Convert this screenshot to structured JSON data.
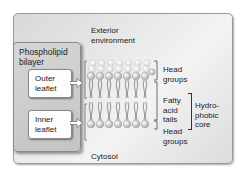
{
  "diagram": {
    "title_panel": {
      "label_line1": "Phospholipid",
      "label_line2": "bilayer"
    },
    "outer_leaflet": {
      "line1": "Outer",
      "line2": "leaflet"
    },
    "inner_leaflet": {
      "line1": "Inner",
      "line2": "leaflet"
    },
    "exterior": {
      "line1": "Exterior",
      "line2": "environment"
    },
    "cytosol": "Cytosol",
    "right_labels": {
      "head_groups_top": {
        "line1": "Head",
        "line2": "groups"
      },
      "fatty_acid_tails": {
        "line1": "Fatty",
        "line2": "acid",
        "line3": "tails"
      },
      "head_groups_bottom": {
        "line1": "Head",
        "line2": "groups"
      },
      "hydrophobic_core": {
        "line1": "Hydro-",
        "line2": "phobic",
        "line3": "core"
      }
    },
    "colors": {
      "panel_background": "#e6e6e6",
      "left_panel": "#cbcbcb",
      "box": "#fdfdfd",
      "head_group": "#e0e0e0",
      "tail": "#555555"
    }
  }
}
